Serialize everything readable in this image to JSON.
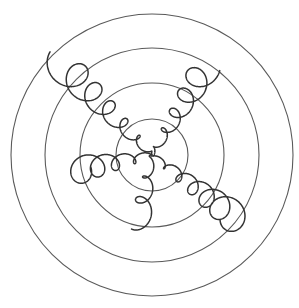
{
  "figure": {
    "width": 299,
    "height": 308,
    "background": "#ffffff",
    "center": [
      152,
      155
    ],
    "rings": {
      "color": "#5a5a5a",
      "radii": [
        36,
        72,
        107,
        141
      ]
    },
    "arms": {
      "color": "#333333",
      "items": [
        {
          "name": "arm-northwest",
          "end": [
            62,
            64
          ],
          "loops": 6,
          "r_start": 2,
          "r_end": 17,
          "phase": 0.0,
          "dir": 1
        },
        {
          "name": "arm-northeast",
          "end": [
            205,
            68
          ],
          "loops": 5,
          "r_start": 2,
          "r_end": 15,
          "phase": 1.2,
          "dir": -1
        },
        {
          "name": "arm-southeast",
          "end": [
            236,
            218
          ],
          "loops": 6,
          "r_start": 2,
          "r_end": 16,
          "phase": 2.4,
          "dir": 1
        },
        {
          "name": "arm-west",
          "end": [
            76,
            170
          ],
          "loops": 4,
          "r_start": 3,
          "r_end": 15,
          "phase": 3.1,
          "dir": -1
        },
        {
          "name": "arm-south",
          "end": [
            140,
            222
          ],
          "loops": 3,
          "r_start": 2,
          "r_end": 11,
          "phase": 0.7,
          "dir": 1
        }
      ]
    }
  }
}
